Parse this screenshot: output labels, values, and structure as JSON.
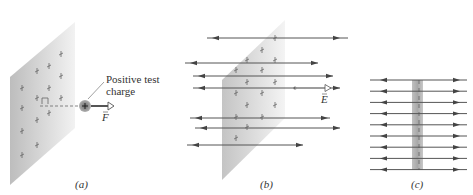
{
  "panels": [
    {
      "id": "a",
      "caption": "(a)",
      "annotation": [
        "Positive test",
        "charge"
      ],
      "force_label": "F",
      "charge_symbol": "+"
    },
    {
      "id": "b",
      "caption": "(b)",
      "field_label": "E"
    },
    {
      "id": "c",
      "caption": "(c)"
    }
  ],
  "colors": {
    "sheet": "#c8c8c8",
    "field_line": "#555555",
    "arrowhead": "#444444",
    "charge": "#808080",
    "text": "#333333"
  }
}
